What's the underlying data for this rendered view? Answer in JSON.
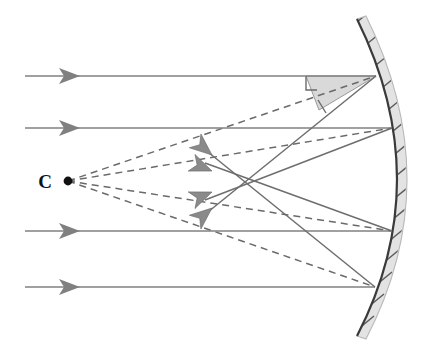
{
  "figure": {
    "type": "optics-ray-diagram",
    "width": 434,
    "height": 354,
    "background_color": "#ffffff"
  },
  "labels": {
    "center_of_curvature": "C"
  },
  "colors": {
    "incident_ray": "#808080",
    "reflected_ray": "#6e6e6e",
    "normal_dashed": "#6a6a6a",
    "mirror_surface": "#3a3a3a",
    "mirror_body": "#e3e3e3",
    "angle_shade": "#d9d9d9",
    "center_dot": "#111111"
  },
  "center_of_curvature": {
    "name": "C",
    "x": 68,
    "y": 181,
    "dot_radius": 4.4,
    "label_offset_x": -23,
    "label_offset_y": 6
  },
  "mirror": {
    "shape": "circular-arc",
    "opens": "left",
    "vertex_x": 397,
    "vertex_y": 181,
    "top_x": 357,
    "top_y": 19,
    "bottom_x": 357,
    "bottom_y": 336,
    "thickness": 9,
    "hatch_count": 15,
    "hatch_length": 15
  },
  "incident_rays": [
    {
      "id": "ray-1",
      "y": 76,
      "x_start": 25,
      "x_end": 376,
      "arrow_x": 73
    },
    {
      "id": "ray-2",
      "y": 128,
      "x_start": 25,
      "x_end": 392,
      "arrow_x": 73
    },
    {
      "id": "ray-3",
      "y": 231,
      "x_start": 25,
      "x_end": 392,
      "arrow_x": 73
    },
    {
      "id": "ray-4",
      "y": 287,
      "x_start": 25,
      "x_end": 375,
      "arrow_x": 73
    }
  ],
  "hit_points": [
    {
      "id": "hit-1",
      "x": 376,
      "y": 76
    },
    {
      "id": "hit-2",
      "x": 392,
      "y": 128
    },
    {
      "id": "hit-3",
      "x": 392,
      "y": 231
    },
    {
      "id": "hit-4",
      "x": 375,
      "y": 287
    }
  ],
  "normals": [
    {
      "id": "normal-1",
      "from_x": 68,
      "from_y": 181,
      "to_x": 376,
      "to_y": 76
    },
    {
      "id": "normal-2",
      "from_x": 68,
      "from_y": 181,
      "to_x": 392,
      "to_y": 128
    },
    {
      "id": "normal-3",
      "from_x": 68,
      "from_y": 181,
      "to_x": 392,
      "to_y": 231
    },
    {
      "id": "normal-4",
      "from_x": 68,
      "from_y": 181,
      "to_x": 375,
      "to_y": 287
    }
  ],
  "reflected_rays": [
    {
      "id": "reflected-1",
      "from_x": 376,
      "from_y": 76,
      "to_x": 205,
      "to_y": 214,
      "note": "outer ray crosses axis nearest the mirror"
    },
    {
      "id": "reflected-2",
      "from_x": 392,
      "from_y": 128,
      "to_x": 207,
      "to_y": 199,
      "note": "inner upper ray"
    },
    {
      "id": "reflected-3",
      "from_x": 392,
      "from_y": 231,
      "to_x": 207,
      "to_y": 163,
      "note": "inner lower ray"
    },
    {
      "id": "reflected-4",
      "from_x": 375,
      "from_y": 287,
      "to_x": 205,
      "to_y": 149,
      "note": "outer lower ray"
    }
  ],
  "focus_arrowheads": [
    {
      "id": "focus-arrow-1",
      "x": 214,
      "y": 157,
      "angle": -141
    },
    {
      "id": "focus-arrow-2",
      "x": 214,
      "y": 172,
      "angle": -159
    },
    {
      "id": "focus-arrow-3",
      "x": 214,
      "y": 191,
      "angle": 159
    },
    {
      "id": "focus-arrow-4",
      "x": 214,
      "y": 206,
      "angle": 141
    }
  ],
  "crossing_point": {
    "x": 241,
    "y": 182
  },
  "angle_of_incidence_marker": {
    "wedge_points": "376,76 305,76 318,109 376,76",
    "tick_path": "M 305,76 L 305,90 L 316,90",
    "second_tick_path": "M 317,101 L 325,112"
  },
  "annotations": {
    "incident_label": "parallel incident rays",
    "normal_label": "radii / normals through C",
    "reflected_label": "reflected rays",
    "aberration_label": "reflected rays cross the axis at different points"
  }
}
